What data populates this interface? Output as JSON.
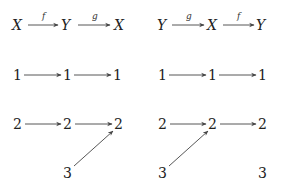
{
  "diagram": {
    "left": {
      "header": {
        "nodes": [
          "X",
          "Y",
          "X"
        ],
        "arrows": [
          {
            "label": "f"
          },
          {
            "label": "g"
          }
        ]
      },
      "rows": [
        {
          "nodes": [
            "1",
            "1",
            "1"
          ]
        },
        {
          "nodes": [
            "2",
            "2",
            "2"
          ]
        },
        {
          "nodes": [
            "3"
          ],
          "note": "3 maps diagonally to the third 2"
        }
      ]
    },
    "right": {
      "header": {
        "nodes": [
          "Y",
          "X",
          "Y"
        ],
        "arrows": [
          {
            "label": "g"
          },
          {
            "label": "f"
          }
        ]
      },
      "rows": [
        {
          "nodes": [
            "1",
            "1",
            "1"
          ]
        },
        {
          "nodes": [
            "2",
            "2",
            "2"
          ]
        },
        {
          "nodes": [
            "3",
            "3"
          ],
          "note": "first 3 maps diagonally to the middle 2; last 3 is unmapped"
        }
      ]
    }
  }
}
